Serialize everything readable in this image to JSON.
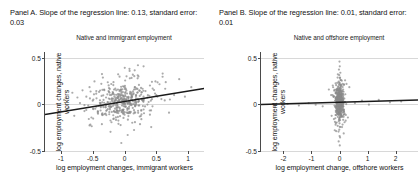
{
  "figure": {
    "background_color": "#ffffff",
    "point_color": "#8a8a8a",
    "line_color": "#1a1a1a",
    "axis_color": "#4a4a4a",
    "grid_color": "#d8d8d8"
  },
  "panels": [
    {
      "header": "Panel A. Slope of the regression line: 0.13, standard error: 0.03",
      "subtitle": "Native and immigrant employment",
      "xlabel": "log employment changes, immigrant workers",
      "ylabel": "log employment changes, native workers",
      "xticks": [
        "-1",
        "-0.5",
        "0",
        "0.5",
        "1"
      ],
      "yticks": [
        "0.5",
        "0",
        "-0.5"
      ]
    },
    {
      "header": "Panel B. Slope of the regression line: 0.01, standard error: 0.01",
      "subtitle": "Native and offshore employment",
      "xlabel": "log employment change, offshore workers",
      "ylabel": "log employment changes, native workers",
      "xticks": [
        "-2",
        "-1",
        "0",
        "1",
        "2"
      ],
      "yticks": [
        "0.5",
        "0",
        "-0.5"
      ]
    }
  ],
  "chart_data": [
    {
      "type": "scatter",
      "title": "Native and immigrant employment",
      "subtitle": "Panel A. Slope of the regression line: 0.13, standard error: 0.03",
      "xlabel": "log employment changes, immigrant workers",
      "ylabel": "log employment changes, native workers",
      "xlim": [
        -1.25,
        1.25
      ],
      "ylim": [
        -0.62,
        0.62
      ],
      "xticks": [
        -1,
        -0.5,
        0,
        0.5,
        1
      ],
      "yticks": [
        0.5,
        0,
        -0.5
      ],
      "grid": "horizontal",
      "legend": "none",
      "slope": 0.13,
      "standard_error": 0.03,
      "intercept": 0.0,
      "fit_line": {
        "x": [
          -1.25,
          1.25
        ],
        "y": [
          -0.1625,
          0.1625
        ]
      },
      "marker": {
        "shape": "circle",
        "color": "#8a8a8a",
        "size": 1.1
      },
      "n_points": 420,
      "cloud": {
        "center_x": 0.0,
        "center_y": 0.0,
        "sd_x": 0.24,
        "sd_y": 0.14
      },
      "points": [
        [
          -0.95,
          0.02
        ],
        [
          -0.88,
          -0.08
        ],
        [
          -0.82,
          0.11
        ],
        [
          -0.79,
          -0.18
        ],
        [
          -0.74,
          0.05
        ],
        [
          -0.7,
          -0.02
        ],
        [
          -0.66,
          0.14
        ],
        [
          -0.63,
          -0.12
        ],
        [
          -0.6,
          0.06
        ],
        [
          -0.57,
          -0.05
        ],
        [
          -0.55,
          0.18
        ],
        [
          -0.52,
          -0.2
        ],
        [
          -0.5,
          0.01
        ],
        [
          -0.48,
          0.09
        ],
        [
          -0.46,
          -0.09
        ],
        [
          -0.44,
          0.04
        ],
        [
          -0.42,
          -0.14
        ],
        [
          -0.4,
          0.12
        ],
        [
          -0.38,
          -0.03
        ],
        [
          -0.36,
          0.07
        ],
        [
          -0.35,
          -0.17
        ],
        [
          -0.33,
          0.02
        ],
        [
          -0.32,
          0.15
        ],
        [
          -0.3,
          -0.07
        ],
        [
          -0.29,
          0.05
        ],
        [
          -0.28,
          -0.11
        ],
        [
          -0.27,
          0.09
        ],
        [
          -0.26,
          -0.01
        ],
        [
          -0.25,
          0.13
        ],
        [
          -0.24,
          -0.16
        ],
        [
          -0.23,
          0.03
        ],
        [
          -0.22,
          -0.06
        ],
        [
          -0.21,
          0.08
        ],
        [
          -0.2,
          -0.13
        ],
        [
          -0.19,
          0.0
        ],
        [
          -0.18,
          0.11
        ],
        [
          -0.17,
          -0.04
        ],
        [
          -0.16,
          0.06
        ],
        [
          -0.15,
          -0.09
        ],
        [
          -0.14,
          0.02
        ],
        [
          -0.13,
          0.14
        ],
        [
          -0.12,
          -0.02
        ],
        [
          -0.11,
          0.05
        ],
        [
          -0.1,
          -0.07
        ],
        [
          -0.09,
          0.09
        ],
        [
          -0.08,
          0.0
        ],
        [
          -0.07,
          -0.11
        ],
        [
          -0.06,
          0.04
        ],
        [
          -0.05,
          0.12
        ],
        [
          -0.04,
          -0.05
        ],
        [
          -0.03,
          0.02
        ],
        [
          -0.02,
          0.07
        ],
        [
          -0.01,
          -0.03
        ],
        [
          0.0,
          0.01
        ],
        [
          0.01,
          0.08
        ],
        [
          0.02,
          -0.06
        ],
        [
          0.03,
          0.03
        ],
        [
          0.04,
          0.1
        ],
        [
          0.05,
          -0.02
        ],
        [
          0.06,
          0.05
        ],
        [
          0.07,
          -0.09
        ],
        [
          0.08,
          0.0
        ],
        [
          0.09,
          0.12
        ],
        [
          0.1,
          -0.04
        ],
        [
          0.11,
          0.06
        ],
        [
          0.12,
          0.02
        ],
        [
          0.13,
          -0.08
        ],
        [
          0.14,
          0.09
        ],
        [
          0.15,
          0.15
        ],
        [
          0.16,
          -0.01
        ],
        [
          0.18,
          0.04
        ],
        [
          0.2,
          0.11
        ],
        [
          0.22,
          -0.05
        ],
        [
          0.24,
          0.07
        ],
        [
          0.26,
          0.17
        ],
        [
          0.28,
          0.02
        ],
        [
          0.3,
          -0.1
        ],
        [
          0.33,
          0.13
        ],
        [
          0.36,
          0.05
        ],
        [
          0.4,
          0.2
        ],
        [
          0.44,
          -0.06
        ],
        [
          0.48,
          0.1
        ],
        [
          0.52,
          0.24
        ],
        [
          0.58,
          0.03
        ],
        [
          0.64,
          0.16
        ],
        [
          0.7,
          -0.14
        ],
        [
          0.78,
          0.08
        ],
        [
          0.86,
          0.28
        ],
        [
          0.95,
          0.06
        ],
        [
          1.05,
          0.18
        ],
        [
          -0.22,
          -0.38
        ],
        [
          -0.1,
          0.34
        ],
        [
          0.05,
          -0.42
        ],
        [
          0.16,
          0.39
        ],
        [
          -0.34,
          0.3
        ],
        [
          0.42,
          -0.32
        ],
        [
          0.6,
          0.35
        ],
        [
          -0.55,
          -0.3
        ],
        [
          0.3,
          0.44
        ],
        [
          -0.05,
          -0.52
        ]
      ]
    },
    {
      "type": "scatter",
      "title": "Native and offshore employment",
      "subtitle": "Panel B. Slope of the regression line: 0.01, standard error: 0.01",
      "xlabel": "log employment change, offshore workers",
      "ylabel": "log employment changes, native workers",
      "xlim": [
        -2.8,
        2.8
      ],
      "ylim": [
        -0.62,
        0.62
      ],
      "xticks": [
        -2,
        -1,
        0,
        1,
        2
      ],
      "yticks": [
        0.5,
        0,
        -0.5
      ],
      "grid": "horizontal",
      "legend": "none",
      "slope": 0.01,
      "standard_error": 0.01,
      "intercept": -0.01,
      "fit_line": {
        "x": [
          -2.8,
          2.8
        ],
        "y": [
          -0.038,
          0.018
        ]
      },
      "marker": {
        "shape": "circle",
        "color": "#8a8a8a",
        "size": 1.1
      },
      "n_points": 420,
      "cloud": {
        "center_x": 0.0,
        "center_y": -0.01,
        "sd_x": 0.09,
        "sd_y": 0.13
      },
      "points": [
        [
          0.0,
          0.5
        ],
        [
          0.01,
          0.44
        ],
        [
          -0.02,
          0.4
        ],
        [
          0.03,
          0.36
        ],
        [
          -0.01,
          0.33
        ],
        [
          0.02,
          0.3
        ],
        [
          0.04,
          0.27
        ],
        [
          -0.03,
          0.25
        ],
        [
          0.01,
          0.23
        ],
        [
          0.05,
          0.21
        ],
        [
          -0.04,
          0.19
        ],
        [
          0.02,
          0.17
        ],
        [
          0.06,
          0.16
        ],
        [
          -0.02,
          0.15
        ],
        [
          0.03,
          0.14
        ],
        [
          -0.05,
          0.13
        ],
        [
          0.0,
          0.12
        ],
        [
          0.07,
          0.11
        ],
        [
          -0.03,
          0.1
        ],
        [
          0.04,
          0.09
        ],
        [
          -0.06,
          0.09
        ],
        [
          0.01,
          0.08
        ],
        [
          0.08,
          0.07
        ],
        [
          -0.04,
          0.07
        ],
        [
          0.05,
          0.06
        ],
        [
          -0.07,
          0.05
        ],
        [
          0.02,
          0.05
        ],
        [
          0.09,
          0.04
        ],
        [
          -0.05,
          0.04
        ],
        [
          0.06,
          0.03
        ],
        [
          -0.08,
          0.03
        ],
        [
          0.03,
          0.02
        ],
        [
          0.1,
          0.02
        ],
        [
          -0.06,
          0.01
        ],
        [
          0.07,
          0.01
        ],
        [
          -0.09,
          0.0
        ],
        [
          0.0,
          0.0
        ],
        [
          0.11,
          -0.01
        ],
        [
          -0.07,
          -0.01
        ],
        [
          0.04,
          -0.02
        ],
        [
          -0.1,
          -0.02
        ],
        [
          0.08,
          -0.03
        ],
        [
          0.12,
          -0.03
        ],
        [
          -0.08,
          -0.04
        ],
        [
          0.05,
          -0.04
        ],
        [
          -0.11,
          -0.05
        ],
        [
          0.09,
          -0.05
        ],
        [
          0.13,
          -0.06
        ],
        [
          -0.09,
          -0.06
        ],
        [
          0.06,
          -0.07
        ],
        [
          -0.12,
          -0.08
        ],
        [
          0.1,
          -0.09
        ],
        [
          0.14,
          -0.1
        ],
        [
          -0.1,
          -0.11
        ],
        [
          0.07,
          -0.12
        ],
        [
          -0.13,
          -0.13
        ],
        [
          0.11,
          -0.14
        ],
        [
          0.16,
          -0.16
        ],
        [
          -0.12,
          -0.17
        ],
        [
          0.08,
          -0.19
        ],
        [
          -0.15,
          -0.21
        ],
        [
          0.13,
          -0.23
        ],
        [
          0.18,
          -0.26
        ],
        [
          -0.14,
          -0.29
        ],
        [
          0.09,
          -0.32
        ],
        [
          -0.17,
          -0.36
        ],
        [
          0.15,
          -0.4
        ],
        [
          0.02,
          -0.45
        ],
        [
          -0.03,
          -0.5
        ],
        [
          0.01,
          -0.55
        ],
        [
          -0.6,
          -0.06
        ],
        [
          -0.85,
          -0.04
        ],
        [
          -1.1,
          -0.02
        ],
        [
          -1.45,
          -0.05
        ],
        [
          -1.85,
          -0.03
        ],
        [
          0.55,
          -0.02
        ],
        [
          0.8,
          0.01
        ],
        [
          1.05,
          -0.04
        ],
        [
          1.4,
          0.02
        ],
        [
          1.8,
          -0.01
        ],
        [
          2.2,
          0.0
        ],
        [
          -2.3,
          -0.07
        ],
        [
          0.35,
          0.18
        ],
        [
          -0.38,
          0.15
        ],
        [
          0.3,
          -0.2
        ],
        [
          -0.28,
          -0.18
        ],
        [
          0.25,
          0.22
        ],
        [
          -0.24,
          0.2
        ],
        [
          0.22,
          -0.24
        ],
        [
          -0.2,
          -0.22
        ]
      ]
    }
  ]
}
